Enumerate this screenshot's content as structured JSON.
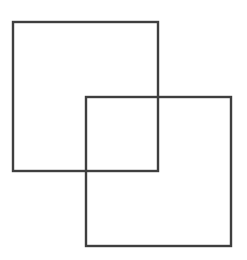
{
  "diagram": {
    "title": "",
    "stroke_color": "#3f3f3f",
    "background": "#ffffff",
    "shapes": [
      {
        "id": "square-1",
        "type": "rect",
        "x": 13,
        "y": 22,
        "width": 145,
        "height": 149
      },
      {
        "id": "square-2",
        "type": "rect",
        "x": 86,
        "y": 97,
        "width": 145,
        "height": 149
      }
    ]
  }
}
